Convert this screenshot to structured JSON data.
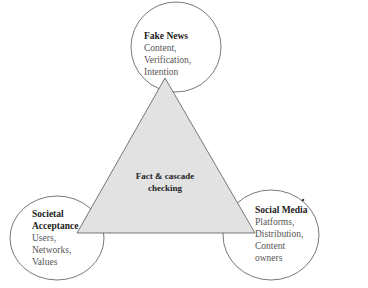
{
  "diagram": {
    "center": {
      "lines": [
        "Fact & cascade",
        "checking"
      ]
    },
    "nodes": [
      {
        "id": "top",
        "title": "Fake News",
        "items": [
          "Content,",
          "Verification,",
          "Intention"
        ]
      },
      {
        "id": "bottom-left",
        "title_lines": [
          "Societal",
          "Acceptance"
        ],
        "items": [
          "Users,",
          "Networks,",
          "Values"
        ]
      },
      {
        "id": "bottom-right",
        "title": "Social Media",
        "items": [
          "Platforms,",
          "Distribution,",
          "Content",
          "owners"
        ]
      }
    ],
    "colors": {
      "triangle_fill": "#e2e2e2",
      "stroke": "#555555",
      "circle_fill": "#ffffff"
    }
  }
}
